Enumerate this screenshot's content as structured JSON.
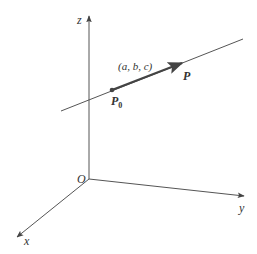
{
  "diagram": {
    "title": "",
    "colors": {
      "line": "#555555",
      "vector": "#444444",
      "text": "#333333",
      "background": "#ffffff"
    },
    "axes": {
      "origin": {
        "label": "O",
        "x": 89,
        "y": 179
      },
      "z": {
        "label": "z",
        "tip": [
          89,
          15
        ]
      },
      "y": {
        "label": "y",
        "tip": [
          245,
          196
        ]
      },
      "x": {
        "label": "x",
        "tip": [
          16,
          238
        ]
      }
    },
    "line": {
      "start": [
        61,
        111
      ],
      "end": [
        243,
        39
      ]
    },
    "points": {
      "P0": {
        "label": "P",
        "subscript": "0",
        "x": 112,
        "y": 90
      },
      "P": {
        "label": "P",
        "x": 188,
        "y": 74
      }
    },
    "vector": {
      "label": "(a, b, c)",
      "from": [
        112,
        90
      ],
      "to": [
        183,
        63
      ]
    }
  }
}
